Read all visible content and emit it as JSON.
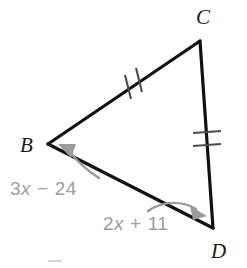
{
  "figure": {
    "kind": "geometry-diagram",
    "shape": "triangle",
    "background_color": "#ffffff",
    "line_color": "#111111",
    "label_color": "#9c9c9c",
    "vertex_label_color": "#1a1a1a",
    "vertices": [
      {
        "name": "B",
        "label": "B",
        "x": 48,
        "y": 144,
        "label_x": 20,
        "label_y": 152
      },
      {
        "name": "C",
        "label": "C",
        "x": 200,
        "y": 41,
        "label_x": 196,
        "label_y": 24
      },
      {
        "name": "D",
        "label": "D",
        "x": 213,
        "y": 228,
        "label_x": 211,
        "label_y": 258
      }
    ],
    "edges": [
      {
        "name": "edge-bc",
        "from": "B",
        "to": "C",
        "ticks": 2,
        "tick_style": "slanted"
      },
      {
        "name": "edge-cd",
        "from": "C",
        "to": "D",
        "ticks": 2,
        "tick_style": "horizontal"
      },
      {
        "name": "edge-bd",
        "from": "B",
        "to": "D",
        "ticks": 0,
        "tick_style": "none"
      }
    ],
    "angle_labels": [
      {
        "name": "angle-b-label",
        "at_vertex": "B",
        "text": "3x − 24",
        "coefficient": "3",
        "variable": "x",
        "operator": "−",
        "constant": "24",
        "x": 10,
        "y": 195
      },
      {
        "name": "angle-d-label",
        "at_vertex": "D",
        "text": "2x + 11",
        "coefficient": "2",
        "variable": "x",
        "operator": "+",
        "constant": "11",
        "x": 103,
        "y": 230
      }
    ],
    "arrows": [
      {
        "name": "arrow-to-b",
        "points_to": "B",
        "color": "#9a9a9a"
      },
      {
        "name": "arrow-to-d",
        "points_to": "D",
        "color": "#9a9a9a"
      }
    ]
  }
}
